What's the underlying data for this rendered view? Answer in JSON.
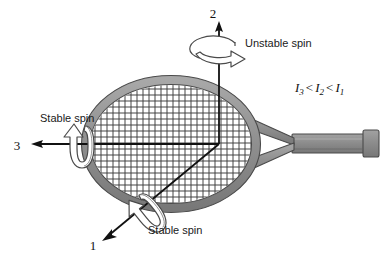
{
  "figure": {
    "object_name": "tennis racket",
    "background_color": "#ffffff",
    "ink_color": "#1a1a1a",
    "frame_color": "#909090",
    "frame_color_dark": "#6e6e6e",
    "string_color": "#3c3c3c"
  },
  "axes": [
    {
      "id": "axis-1",
      "label": "1",
      "label_x": 93,
      "label_y": 250,
      "direction": "down-left",
      "spin_label": "Stable spin",
      "spin_stability": "stable"
    },
    {
      "id": "axis-2",
      "label": "2",
      "label_x": 213,
      "label_y": 18,
      "direction": "up",
      "spin_label": "Unstable spin",
      "spin_stability": "unstable"
    },
    {
      "id": "axis-3",
      "label": "3",
      "label_x": 17,
      "label_y": 150,
      "direction": "left",
      "spin_label": "Stable spin",
      "spin_stability": "stable"
    }
  ],
  "annotations": {
    "unstable_spin": {
      "text": "Unstable spin",
      "x": 245,
      "y": 47
    },
    "stable_spin_left": {
      "text": "Stable spin",
      "x": 40,
      "y": 122
    },
    "stable_spin_bottom": {
      "text": "Stable spin",
      "x": 148,
      "y": 234
    },
    "inertia_inequality": {
      "parts": [
        {
          "symbol": "I",
          "subscript": "3"
        },
        {
          "operator": "<"
        },
        {
          "symbol": "I",
          "subscript": "2"
        },
        {
          "operator": "<"
        },
        {
          "symbol": "I",
          "subscript": "1"
        }
      ],
      "plain_text": "I3 < I2 < I1",
      "x": 295,
      "y": 92
    }
  },
  "origin": {
    "x": 219,
    "y": 144
  }
}
